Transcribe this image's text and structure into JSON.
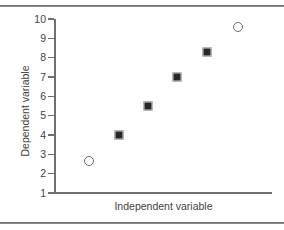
{
  "chart_data": {
    "type": "scatter",
    "title": "",
    "xlabel": "Independent variable",
    "ylabel": "Dependent variable",
    "xlim": [
      0,
      7
    ],
    "ylim": [
      1,
      10
    ],
    "grid": false,
    "legend": null,
    "ytick_labels": [
      "10",
      "9",
      "8",
      "7",
      "6",
      "5",
      "4",
      "3",
      "2",
      "1"
    ],
    "ytick_values": [
      10,
      9,
      8,
      7,
      6,
      5,
      4,
      3,
      2,
      1
    ],
    "xtick_labels": [],
    "series": [
      {
        "name": "outliers",
        "marker": "open-circle",
        "color": "#6a6a6a",
        "points": [
          {
            "x": 1.1,
            "y": 2.65
          },
          {
            "x": 5.9,
            "y": 9.6
          }
        ]
      },
      {
        "name": "data",
        "marker": "filled-square",
        "color": "#272727",
        "points": [
          {
            "x": 2.05,
            "y": 4.0
          },
          {
            "x": 3.0,
            "y": 5.5
          },
          {
            "x": 3.95,
            "y": 7.0
          },
          {
            "x": 4.9,
            "y": 8.3
          }
        ]
      }
    ]
  },
  "figure": {
    "top_rule": "horizontal-rule",
    "bottom_rule": "horizontal-rule"
  }
}
